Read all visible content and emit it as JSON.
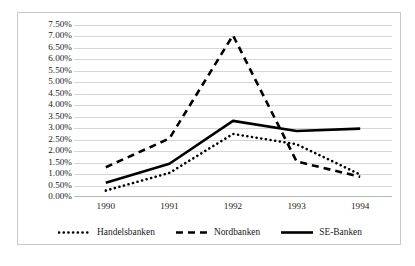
{
  "chart_data": {
    "type": "line",
    "title": "",
    "subtitle": "",
    "xlabel": "",
    "ylabel": "",
    "categories": [
      "1990",
      "1991",
      "1992",
      "1993",
      "1994"
    ],
    "x": [
      1990,
      1991,
      1992,
      1993,
      1994
    ],
    "ylim": [
      0,
      7.5
    ],
    "ytick_values": [
      0,
      0.5,
      1.0,
      1.5,
      2.0,
      2.5,
      3.0,
      3.5,
      4.0,
      4.5,
      5.0,
      5.5,
      6.0,
      6.5,
      7.0,
      7.5
    ],
    "ytick_labels": [
      "0.00%",
      "0.50%",
      "1.00%",
      "1.50%",
      "2.00%",
      "2.50%",
      "3.00%",
      "3.50%",
      "4.00%",
      "4.50%",
      "5.00%",
      "5.50%",
      "6.00%",
      "6.50%",
      "7.00%",
      "7.50%"
    ],
    "value_unit": "percent",
    "grid": true,
    "grid_axis": "y",
    "legend_position": "bottom",
    "series": [
      {
        "name": "Handelsbanken",
        "style": "dotted",
        "color": "#000000",
        "values": [
          0.28,
          1.05,
          2.75,
          2.3,
          0.98
        ]
      },
      {
        "name": "Nordbanken",
        "style": "dashed",
        "color": "#000000",
        "values": [
          1.3,
          2.55,
          7.05,
          1.55,
          0.88
        ]
      },
      {
        "name": "SE-Banken",
        "style": "solid",
        "color": "#000000",
        "values": [
          0.62,
          1.45,
          3.32,
          2.88,
          2.98
        ]
      }
    ]
  },
  "legend": {
    "items": [
      {
        "label": "Handelsbanken",
        "marker": "dotted-line-marker"
      },
      {
        "label": "Nordbanken",
        "marker": "dashed-line-marker"
      },
      {
        "label": "SE-Banken",
        "marker": "solid-line-marker"
      }
    ]
  },
  "colors": {
    "series": "#000000",
    "gridline": "#d6d6d6",
    "border": "#c9c9c9",
    "axis": "#b9b9b9",
    "text": "#222222",
    "background": "#ffffff"
  }
}
